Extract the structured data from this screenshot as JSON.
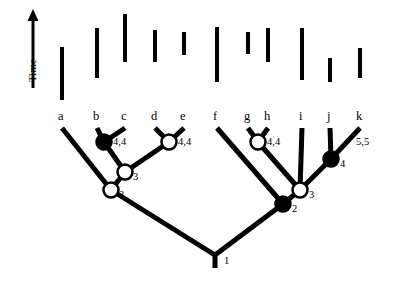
{
  "figure": {
    "axis": {
      "label": "Time",
      "orientation": "vertical-up"
    },
    "colors": {
      "stroke": "#000000",
      "filled_node": "#000000",
      "open_node": "#ffffff",
      "background": "#ffffff"
    }
  },
  "taxa": [
    {
      "id": "a",
      "label": "a",
      "x": 62,
      "tip_y": 122
    },
    {
      "id": "b",
      "label": "b",
      "x": 97,
      "tip_y": 122
    },
    {
      "id": "c",
      "label": "c",
      "x": 125,
      "tip_y": 122
    },
    {
      "id": "d",
      "label": "d",
      "x": 155,
      "tip_y": 122
    },
    {
      "id": "e",
      "label": "e",
      "x": 184,
      "tip_y": 122
    },
    {
      "id": "f",
      "label": "f",
      "x": 217,
      "tip_y": 122
    },
    {
      "id": "g",
      "label": "g",
      "x": 248,
      "tip_y": 122
    },
    {
      "id": "h",
      "label": "h",
      "x": 268,
      "tip_y": 122
    },
    {
      "id": "i",
      "label": "i",
      "x": 302,
      "tip_y": 122
    },
    {
      "id": "j",
      "label": "j",
      "x": 330,
      "tip_y": 122
    },
    {
      "id": "k",
      "label": "k",
      "x": 360,
      "tip_y": 122
    }
  ],
  "nodes": [
    {
      "id": "n1",
      "label": "1",
      "fill": "none",
      "x": 215,
      "y": 255,
      "label_x": 224,
      "label_y": 260
    },
    {
      "id": "n2left",
      "label": "2",
      "fill": "open",
      "x": 111,
      "y": 190,
      "label_x": 118,
      "label_y": 196
    },
    {
      "id": "n3left",
      "label": "3",
      "fill": "open",
      "x": 125,
      "y": 172,
      "label_x": 132,
      "label_y": 178
    },
    {
      "id": "n4left",
      "label": "4,4",
      "fill": "filled",
      "x": 104,
      "y": 142,
      "label_x": 112,
      "label_y": 145
    },
    {
      "id": "n4mid",
      "label": "4,4",
      "fill": "open",
      "x": 169,
      "y": 142,
      "label_x": 177,
      "label_y": 145
    },
    {
      "id": "n2right",
      "label": "2",
      "fill": "filled",
      "x": 283,
      "y": 204,
      "label_x": 291,
      "label_y": 210
    },
    {
      "id": "n3right",
      "label": "3",
      "fill": "open",
      "x": 300,
      "y": 190,
      "label_x": 308,
      "label_y": 196
    },
    {
      "id": "n4gh",
      "label": "4,4",
      "fill": "open",
      "x": 258,
      "y": 142,
      "label_x": 266,
      "label_y": 145
    },
    {
      "id": "n4ijk",
      "label": "4",
      "fill": "filled",
      "x": 331,
      "y": 159,
      "label_x": 339,
      "label_y": 164
    },
    {
      "id": "n55",
      "label": "5,5",
      "fill": "none",
      "x": 345,
      "y": 142,
      "label_x": 355,
      "label_y": 145
    }
  ],
  "gauge_bars": [
    {
      "x": 62,
      "y_top": 47,
      "y_bottom": 100
    },
    {
      "x": 97,
      "y_top": 28,
      "y_bottom": 78
    },
    {
      "x": 125,
      "y_top": 14,
      "y_bottom": 62
    },
    {
      "x": 155,
      "y_top": 30,
      "y_bottom": 62
    },
    {
      "x": 184,
      "y_top": 32,
      "y_bottom": 55
    },
    {
      "x": 217,
      "y_top": 27,
      "y_bottom": 82
    },
    {
      "x": 248,
      "y_top": 32,
      "y_bottom": 54
    },
    {
      "x": 268,
      "y_top": 28,
      "y_bottom": 62
    },
    {
      "x": 302,
      "y_top": 28,
      "y_bottom": 80
    },
    {
      "x": 330,
      "y_top": 58,
      "y_bottom": 82
    },
    {
      "x": 360,
      "y_top": 48,
      "y_bottom": 78
    }
  ],
  "time_arrow": {
    "x": 33,
    "y_top": 12,
    "y_bottom": 88
  }
}
